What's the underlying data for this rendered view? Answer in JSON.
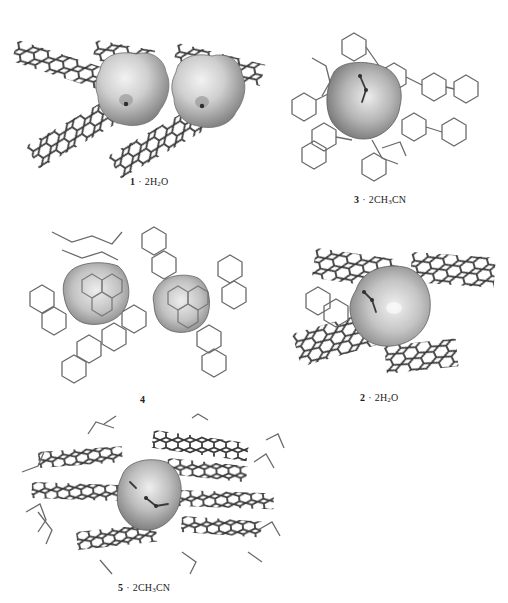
{
  "figure": {
    "panels": [
      {
        "id": "panel-1",
        "compound": "1",
        "solvate": "2H2O",
        "solvate_display": [
          "2H",
          "2",
          "O"
        ],
        "void_count": 2,
        "position": "top-left"
      },
      {
        "id": "panel-3",
        "compound": "3",
        "solvate": "2CH3CN",
        "solvate_display": [
          "2CH",
          "3",
          "CN"
        ],
        "void_count": 1,
        "position": "top-right"
      },
      {
        "id": "panel-4",
        "compound": "4",
        "solvate": "",
        "void_count": 2,
        "position": "middle-left"
      },
      {
        "id": "panel-2",
        "compound": "2",
        "solvate": "2H2O",
        "solvate_display": [
          "2H",
          "2",
          "O"
        ],
        "void_count": 1,
        "position": "middle-right"
      },
      {
        "id": "panel-5",
        "compound": "5",
        "solvate": "2CH3CN",
        "solvate_display": [
          "2CH",
          "3",
          "CN"
        ],
        "void_count": 1,
        "position": "bottom-left"
      }
    ],
    "separator": "·",
    "colors": {
      "bond": "#3a3a3a",
      "void_surface_light": "#e6e6e6",
      "void_surface_mid": "#b8b8b8",
      "void_surface_dark": "#7a7a7a",
      "background": "#ffffff"
    }
  }
}
